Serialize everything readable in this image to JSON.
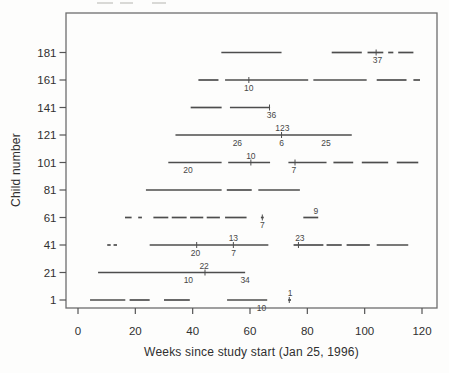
{
  "figure": {
    "background": "#fdfdfc",
    "segment_color": "#4d4d4d",
    "box_color": "#6e6e6e",
    "tick_color": "#555555",
    "text_color": "#303030",
    "annotation_color": "#474747",
    "artifact_color": "#d9d9d6"
  },
  "chart_data": {
    "type": "line",
    "subtype": "horizontal-interval-segment-plot",
    "title": "",
    "xlabel": "Weeks since study start (Jan 25, 1996)",
    "ylabel": "Child number",
    "xticks": [
      0,
      20,
      40,
      60,
      80,
      100,
      120
    ],
    "yticks": [
      1,
      21,
      41,
      61,
      81,
      101,
      121,
      141,
      161,
      181
    ],
    "xlim": [
      -4.2,
      125.2
    ],
    "ylim": [
      -5,
      210
    ],
    "grid": false,
    "legend": null,
    "rows": [
      {
        "child": 1,
        "segments": [
          [
            4.2,
            16.5
          ],
          [
            18,
            25
          ],
          [
            30,
            39
          ],
          [
            52,
            66
          ],
          [
            73.3,
            74.3
          ]
        ],
        "annotations": [
          {
            "text": "10",
            "x": 64,
            "pos": "below"
          },
          {
            "text": "1",
            "x": 74,
            "pos": "above",
            "tick": 73.7
          }
        ]
      },
      {
        "child": 21,
        "segments": [
          [
            7,
            58.3
          ]
        ],
        "annotations": [
          {
            "text": "10",
            "x": 38.5,
            "pos": "below"
          },
          {
            "text": "22",
            "x": 44,
            "pos": "above",
            "tick": 44.3
          },
          {
            "text": "34",
            "x": 58.3,
            "pos": "below"
          }
        ]
      },
      {
        "child": 41,
        "segments": [
          [
            10.2,
            11.4
          ],
          [
            12.4,
            13.6
          ],
          [
            25,
            66.4
          ],
          [
            75.2,
            85.6
          ],
          [
            86.7,
            92
          ],
          [
            93.7,
            101.8
          ],
          [
            104.2,
            115.2
          ]
        ],
        "annotations": [
          {
            "text": "20",
            "x": 41,
            "pos": "below",
            "tick": 41.4
          },
          {
            "text": "13",
            "x": 54.2,
            "pos": "above"
          },
          {
            "text": "7",
            "x": 54.3,
            "pos": "below",
            "tick": 54.2
          },
          {
            "text": "23",
            "x": 77.4,
            "pos": "above",
            "tick": 76.9
          }
        ]
      },
      {
        "child": 61,
        "segments": [
          [
            16.4,
            18.7
          ],
          [
            21,
            22.3
          ],
          [
            26.3,
            31.5
          ],
          [
            32.7,
            37.9
          ],
          [
            39.1,
            43.7
          ],
          [
            44.9,
            49.5
          ],
          [
            51.3,
            58.8
          ],
          [
            63.8,
            64.8
          ],
          [
            78.6,
            83.8
          ]
        ],
        "annotations": [
          {
            "text": "7",
            "x": 64.3,
            "pos": "below",
            "tick": 64.3
          },
          {
            "text": "9",
            "x": 83,
            "pos": "above"
          }
        ]
      },
      {
        "child": 81,
        "segments": [
          [
            23.7,
            50.1
          ],
          [
            51.9,
            60.6
          ],
          [
            62.9,
            77.4
          ]
        ],
        "annotations": []
      },
      {
        "child": 101,
        "segments": [
          [
            31.5,
            50.1
          ],
          [
            52.4,
            67
          ],
          [
            73.4,
            86.7
          ],
          [
            89.1,
            96
          ],
          [
            99,
            108.2
          ],
          [
            111.2,
            118.7
          ]
        ],
        "annotations": [
          {
            "text": "20",
            "x": 38.4,
            "pos": "below"
          },
          {
            "text": "10",
            "x": 60.3,
            "pos": "above",
            "tick": 60.3
          },
          {
            "text": "7",
            "x": 75.3,
            "pos": "below",
            "tick": 75.7
          }
        ]
      },
      {
        "child": 121,
        "segments": [
          [
            34,
            95.5
          ]
        ],
        "annotations": [
          {
            "text": "26",
            "x": 55.6,
            "pos": "below"
          },
          {
            "text": "123",
            "x": 71.3,
            "pos": "above",
            "tick": 71
          },
          {
            "text": "6",
            "x": 71,
            "pos": "below"
          },
          {
            "text": "25",
            "x": 86.5,
            "pos": "below"
          }
        ]
      },
      {
        "child": 141,
        "segments": [
          [
            39.3,
            50.1
          ],
          [
            53,
            67
          ]
        ],
        "annotations": [
          {
            "text": "36",
            "x": 67.5,
            "pos": "below",
            "tick": 66.8
          }
        ]
      },
      {
        "child": 161,
        "segments": [
          [
            42,
            49
          ],
          [
            51.3,
            80.3
          ],
          [
            82.1,
            100.7
          ],
          [
            104.2,
            114.6
          ],
          [
            117,
            119.3
          ]
        ],
        "annotations": [
          {
            "text": "10",
            "x": 59.6,
            "pos": "below",
            "tick": 59.6
          }
        ]
      },
      {
        "child": 181,
        "segments": [
          [
            50,
            71
          ],
          [
            88.5,
            99
          ],
          [
            101,
            106.5
          ],
          [
            108.2,
            110
          ],
          [
            111.7,
            117
          ]
        ],
        "annotations": [
          {
            "text": "37",
            "x": 104.5,
            "pos": "below",
            "tick": 104
          }
        ]
      }
    ],
    "artifacts_top_edge": [
      [
        97,
        113
      ],
      [
        120,
        133
      ],
      [
        152,
        166
      ]
    ]
  }
}
